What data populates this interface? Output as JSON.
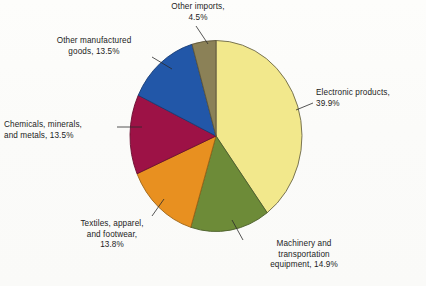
{
  "figure": {
    "background_color": "#fefefe",
    "text_color": "#1c1c1c"
  },
  "chart_data": {
    "type": "pie",
    "title": "",
    "subtitle": "",
    "xlabel": "",
    "ylabel": "",
    "legend_position": "none",
    "labels_position": "outside-with-leader-lines",
    "grid": false,
    "units": "percent",
    "total": 100.1,
    "start_angle_deg": 0,
    "direction": "clockwise",
    "categories": [
      "Electronic products",
      "Machinery and transportation equipment",
      "Textiles, apparel, and footwear",
      "Chemicals, minerals, and metals",
      "Other manufactured goods",
      "Other imports"
    ],
    "values": [
      39.9,
      14.9,
      13.8,
      13.5,
      13.5,
      4.5
    ],
    "colors": [
      "#f2e88c",
      "#6d8b38",
      "#e89020",
      "#9d1246",
      "#2257a8",
      "#8b8157"
    ],
    "slices": [
      {
        "name": "electronic-products",
        "label": "Electronic products,\n39.9%",
        "label_line1": "Electronic products,",
        "label_line2": "39.9%",
        "value": 39.9,
        "color": "#f2e88c"
      },
      {
        "name": "machinery-and-transportation-equipment",
        "label": "Machinery and\ntransportation\nequipment, 14.9%",
        "label_line1": "Machinery and",
        "label_line2": "transportation",
        "label_line3": "equipment, 14.9%",
        "value": 14.9,
        "color": "#6d8b38"
      },
      {
        "name": "textiles-apparel-and-footwear",
        "label": "Textiles, apparel,\nand footwear,\n13.8%",
        "label_line1": "Textiles, apparel,",
        "label_line2": "and footwear,",
        "label_line3": "13.8%",
        "value": 13.8,
        "color": "#e89020"
      },
      {
        "name": "chemicals-minerals-and-metals",
        "label": "Chemicals, minerals,\nand metals, 13.5%",
        "label_line1": "Chemicals, minerals,",
        "label_line2": "and metals, 13.5%",
        "value": 13.5,
        "color": "#9d1246"
      },
      {
        "name": "other-manufactured-goods",
        "label": "Other manufactured\ngoods, 13.5%",
        "label_line1": "Other manufactured",
        "label_line2": "goods, 13.5%",
        "value": 13.5,
        "color": "#2257a8"
      },
      {
        "name": "other-imports",
        "label": "Other imports,\n4.5%",
        "label_line1": "Other imports,",
        "label_line2": "4.5%",
        "value": 4.5,
        "color": "#8b8157"
      }
    ]
  },
  "labels": {
    "other_imports": "Other imports,\n4.5%",
    "other_manufactured_goods": "Other manufactured\ngoods, 13.5%",
    "chemicals_minerals_and_metals": "Chemicals, minerals,\nand metals, 13.5%",
    "textiles_apparel_and_footwear": "Textiles, apparel,\nand footwear,\n13.8%",
    "machinery_and_transportation_equipment": "Machinery and\ntransportation\nequipment, 14.9%",
    "electronic_products": "Electronic products,\n39.9%"
  }
}
